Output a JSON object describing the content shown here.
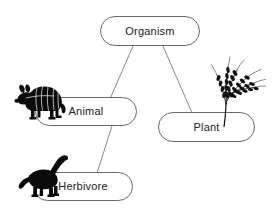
{
  "diagram": {
    "background_color": "#ffffff",
    "node_border_color": "#6a6a6a",
    "edge_color": "#8a8a8a",
    "text_color": "#222222",
    "nodes": [
      {
        "id": "organism",
        "label": "Organism"
      },
      {
        "id": "animal",
        "label": "Animal"
      },
      {
        "id": "plant",
        "label": "Plant"
      },
      {
        "id": "herbivore",
        "label": "Herbivore"
      }
    ],
    "edges": [
      {
        "from": "organism",
        "to": "animal"
      },
      {
        "from": "organism",
        "to": "plant"
      },
      {
        "from": "animal",
        "to": "herbivore"
      }
    ],
    "illustrations": [
      {
        "id": "armadillo",
        "name": "armadillo-silhouette",
        "attached_to": "animal"
      },
      {
        "id": "rice",
        "name": "rice-stalk-silhouette",
        "attached_to": "plant"
      },
      {
        "id": "dinosaur",
        "name": "sauropod-silhouette",
        "attached_to": "herbivore"
      }
    ]
  }
}
